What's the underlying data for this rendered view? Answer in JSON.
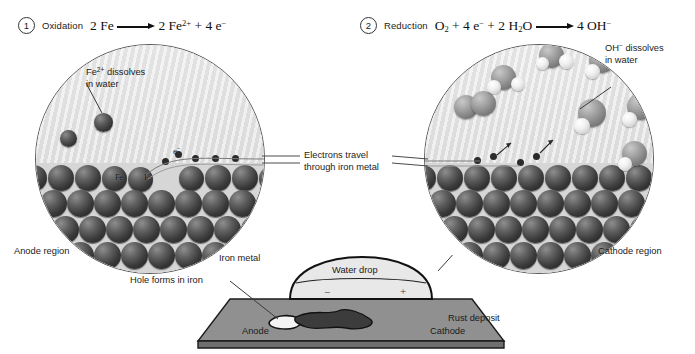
{
  "steps": [
    {
      "number": "1",
      "name": "Oxidation",
      "equation_text": "2 Fe ⟶ 2 Fe2+ + 4 e−",
      "reactant": "2 Fe",
      "product_1": "2 Fe",
      "product_1_charge": "2+",
      "plus": "+",
      "product_2": "4 e",
      "product_2_charge": "−"
    },
    {
      "number": "2",
      "name": "Reduction",
      "equation_text": "O2 + 4 e− + 2 H2O ⟶ 4 OH−",
      "r1": "O",
      "r1_sub": "2",
      "plus1": "+",
      "r2": "4 e",
      "r2_sup": "−",
      "plus2": "+",
      "r3a": "2 H",
      "r3_sub": "2",
      "r3b": "O",
      "product": "4 OH",
      "product_sup": "−"
    }
  ],
  "left_circle": {
    "callout_line1_a": "Fe",
    "callout_line1_sup": "2+",
    "callout_line1_b": " dissolves",
    "callout_line2": "in water",
    "electron_label": "e",
    "electron_sup": "−",
    "atom_labels": [
      "Fe",
      "Fe"
    ],
    "region_label": "Anode region"
  },
  "right_circle": {
    "callout_line1_a": "OH",
    "callout_line1_sup": "−",
    "callout_line1_b": " dissolves",
    "callout_line2": "in water",
    "region_label": "Cathode region"
  },
  "center_label": {
    "line1": "Electrons travel",
    "line2": "through iron metal"
  },
  "bottom_diagram": {
    "iron_metal_label": "Iron metal",
    "hole_label": "Hole forms in iron",
    "water_drop_label": "Water drop",
    "rust_label": "Rust deposit",
    "anode_label": "Anode",
    "cathode_label": "Cathode",
    "minus_sign": "−",
    "plus_sign": "+"
  },
  "colors": {
    "background": "#ffffff",
    "water": "#e3e3e3",
    "iron_atom_dark": "#3a3a3a",
    "oxygen_sphere": "#8f8f8f",
    "hydrogen_sphere": "#f2f2f2",
    "plate_top": "#909090",
    "plate_front": "#6f6f6f",
    "leader_line": "#4a4a4a",
    "text": "#1b1b1b"
  }
}
